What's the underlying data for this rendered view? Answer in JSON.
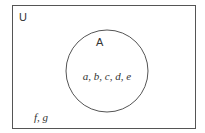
{
  "diagram": {
    "type": "venn",
    "universe": {
      "label": "U",
      "outside_elements": "f, g"
    },
    "sets": [
      {
        "label": "A",
        "elements": "a, b, c, d, e"
      }
    ],
    "colors": {
      "stroke": "#555555",
      "text": "#333333",
      "background": "#ffffff"
    }
  }
}
